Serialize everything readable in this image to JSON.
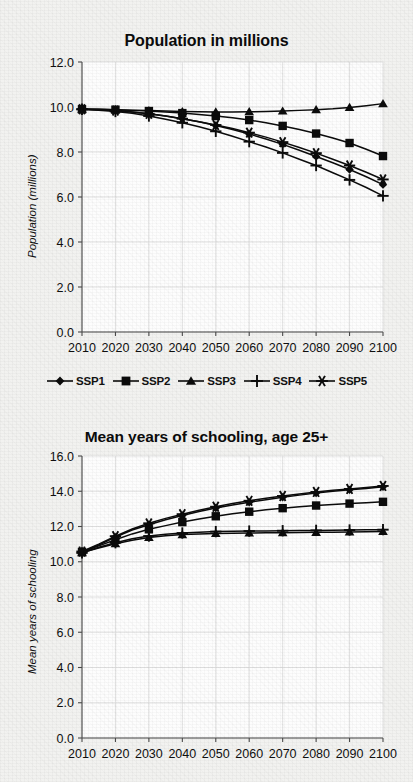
{
  "document": {
    "background_color": "#f2f2f0",
    "ink_color": "#0b0b0b",
    "kind": "scanned-figure-page"
  },
  "legend": {
    "position": "below-top-chart",
    "items": [
      {
        "label": "SSP1",
        "marker": "diamond-marker"
      },
      {
        "label": "SSP2",
        "marker": "square-marker"
      },
      {
        "label": "SSP3",
        "marker": "triangle-marker"
      },
      {
        "label": "SSP4",
        "marker": "plus-marker"
      },
      {
        "label": "SSP5",
        "marker": "asterisk-marker"
      }
    ]
  },
  "chart_data": [
    {
      "id": "population",
      "type": "line",
      "title": "Population in millions",
      "xlabel": "",
      "ylabel": "Population (millions)",
      "xlim": [
        2010,
        2100
      ],
      "ylim": [
        0.0,
        12.0
      ],
      "yticks": [
        "0.0",
        "2.0",
        "4.0",
        "6.0",
        "8.0",
        "10.0",
        "12.0"
      ],
      "xticks": [
        "2010",
        "2020",
        "2030",
        "2040",
        "2050",
        "2060",
        "2070",
        "2080",
        "2090",
        "2100"
      ],
      "grid": true,
      "legend_position": "bottom",
      "x": [
        2010,
        2015,
        2020,
        2025,
        2030,
        2035,
        2040,
        2045,
        2050,
        2055,
        2060,
        2065,
        2070,
        2075,
        2080,
        2085,
        2090,
        2095,
        2100
      ],
      "series": [
        {
          "name": "SSP1",
          "marker": "diamond-marker",
          "values": [
            9.9,
            9.88,
            9.84,
            9.78,
            9.7,
            9.6,
            9.48,
            9.34,
            9.18,
            9.0,
            8.8,
            8.58,
            8.34,
            8.08,
            7.8,
            7.52,
            7.22,
            6.9,
            6.55
          ]
        },
        {
          "name": "SSP2",
          "marker": "square-marker",
          "values": [
            9.9,
            9.9,
            9.88,
            9.85,
            9.82,
            9.78,
            9.73,
            9.67,
            9.6,
            9.52,
            9.42,
            9.3,
            9.16,
            9.0,
            8.82,
            8.62,
            8.4,
            8.12,
            7.82
          ]
        },
        {
          "name": "SSP3",
          "marker": "triangle-marker",
          "values": [
            9.9,
            9.9,
            9.88,
            9.86,
            9.84,
            9.82,
            9.8,
            9.79,
            9.78,
            9.78,
            9.79,
            9.8,
            9.82,
            9.85,
            9.88,
            9.92,
            9.98,
            10.06,
            10.15
          ]
        },
        {
          "name": "SSP4",
          "marker": "plus-marker",
          "values": [
            9.9,
            9.86,
            9.8,
            9.72,
            9.6,
            9.46,
            9.3,
            9.12,
            8.92,
            8.7,
            8.46,
            8.22,
            7.96,
            7.68,
            7.4,
            7.08,
            6.76,
            6.42,
            6.05
          ]
        },
        {
          "name": "SSP5",
          "marker": "asterisk-marker",
          "values": [
            9.9,
            9.88,
            9.84,
            9.78,
            9.7,
            9.6,
            9.48,
            9.34,
            9.2,
            9.04,
            8.86,
            8.66,
            8.44,
            8.2,
            7.95,
            7.68,
            7.4,
            7.1,
            6.78
          ]
        }
      ]
    },
    {
      "id": "schooling",
      "type": "line",
      "title": "Mean years of schooling, age 25+",
      "xlabel": "",
      "ylabel": "Mean years of schooling",
      "xlim": [
        2010,
        2100
      ],
      "ylim": [
        0.0,
        16.0
      ],
      "yticks": [
        "0.0",
        "2.0",
        "4.0",
        "6.0",
        "8.0",
        "10.0",
        "12.0",
        "14.0",
        "16.0"
      ],
      "xticks": [
        "2010",
        "2020",
        "2030",
        "2040",
        "2050",
        "2060",
        "2070",
        "2080",
        "2090",
        "2100"
      ],
      "grid": true,
      "legend_position": "none",
      "x": [
        2010,
        2015,
        2020,
        2025,
        2030,
        2035,
        2040,
        2045,
        2050,
        2055,
        2060,
        2065,
        2070,
        2075,
        2080,
        2085,
        2090,
        2095,
        2100
      ],
      "series": [
        {
          "name": "SSP1",
          "marker": "diamond-marker",
          "values": [
            10.55,
            10.95,
            11.4,
            11.8,
            12.1,
            12.38,
            12.62,
            12.85,
            13.05,
            13.22,
            13.38,
            13.52,
            13.66,
            13.78,
            13.9,
            14.0,
            14.08,
            14.16,
            14.25
          ]
        },
        {
          "name": "SSP2",
          "marker": "square-marker",
          "values": [
            10.55,
            10.9,
            11.25,
            11.58,
            11.84,
            12.05,
            12.25,
            12.42,
            12.58,
            12.72,
            12.84,
            12.95,
            13.04,
            13.12,
            13.19,
            13.25,
            13.3,
            13.35,
            13.4
          ]
        },
        {
          "name": "SSP3",
          "marker": "triangle-marker",
          "values": [
            10.52,
            10.78,
            11.02,
            11.22,
            11.38,
            11.48,
            11.54,
            11.58,
            11.6,
            11.62,
            11.63,
            11.64,
            11.65,
            11.66,
            11.67,
            11.68,
            11.69,
            11.7,
            11.72
          ]
        },
        {
          "name": "SSP4",
          "marker": "plus-marker",
          "values": [
            10.5,
            10.82,
            11.08,
            11.3,
            11.46,
            11.56,
            11.63,
            11.68,
            11.71,
            11.73,
            11.74,
            11.75,
            11.76,
            11.77,
            11.78,
            11.79,
            11.8,
            11.81,
            11.82
          ]
        },
        {
          "name": "SSP5",
          "marker": "asterisk-marker",
          "values": [
            10.58,
            11.0,
            11.45,
            11.86,
            12.18,
            12.46,
            12.7,
            12.92,
            13.12,
            13.3,
            13.46,
            13.6,
            13.73,
            13.85,
            13.96,
            14.05,
            14.13,
            14.21,
            14.3
          ]
        }
      ]
    }
  ]
}
